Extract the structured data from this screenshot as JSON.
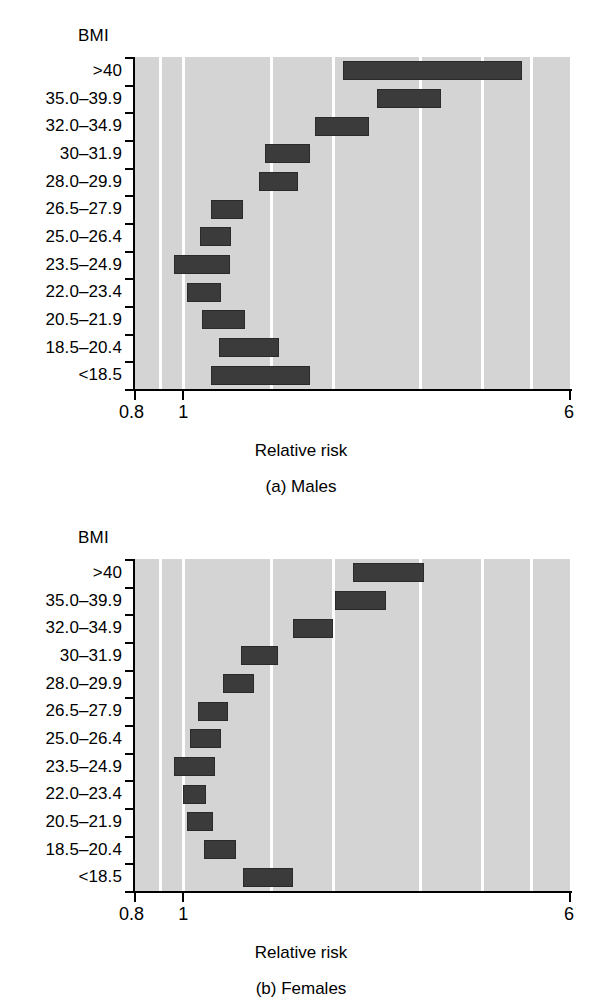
{
  "figure": {
    "panels": [
      {
        "id": "males",
        "bmi_axis_title": "BMI",
        "caption": "(a) Males",
        "xlabel": "Relative risk"
      },
      {
        "id": "females",
        "bmi_axis_title": "BMI",
        "caption": "(b) Females",
        "xlabel": "Relative risk"
      }
    ]
  },
  "chart_data": [
    {
      "type": "bar",
      "orientation": "horizontal",
      "title": "(a) Males",
      "xlabel": "Relative risk",
      "ylabel": "BMI",
      "xscale": "log",
      "xlim": [
        0.8,
        6
      ],
      "xticks": [
        0.8,
        6
      ],
      "xticklabels": [
        "0.8",
        "6"
      ],
      "gridlines": [
        0.9,
        1,
        1.5,
        2,
        3,
        4,
        5
      ],
      "grid": true,
      "legend": "none",
      "categories": [
        ">40",
        "35.0–39.9",
        "32.0–34.9",
        "30–31.9",
        "28.0–29.9",
        "26.5–27.9",
        "25.0–26.4",
        "23.5–24.9",
        "22.0–23.4",
        "20.5–21.9",
        "18.5–20.4",
        "<18.5"
      ],
      "intervals": [
        {
          "category": ">40",
          "low": 2.1,
          "high": 4.8
        },
        {
          "category": "35.0–39.9",
          "low": 2.45,
          "high": 3.3
        },
        {
          "category": "32.0–34.9",
          "low": 1.84,
          "high": 2.37
        },
        {
          "category": "30–31.9",
          "low": 1.46,
          "high": 1.8
        },
        {
          "category": "28.0–29.9",
          "low": 1.42,
          "high": 1.7
        },
        {
          "category": "26.5–27.9",
          "low": 1.14,
          "high": 1.32
        },
        {
          "category": "25.0–26.4",
          "low": 1.08,
          "high": 1.25
        },
        {
          "category": "23.5–24.9",
          "low": 0.96,
          "high": 1.24
        },
        {
          "category": "22.0–23.4",
          "low": 1.02,
          "high": 1.19
        },
        {
          "category": "20.5–21.9",
          "low": 1.09,
          "high": 1.33
        },
        {
          "category": "18.5–20.4",
          "low": 1.18,
          "high": 1.56
        },
        {
          "category": "<18.5",
          "low": 1.14,
          "high": 1.8
        }
      ]
    },
    {
      "type": "bar",
      "orientation": "horizontal",
      "title": "(b) Females",
      "xlabel": "Relative risk",
      "ylabel": "BMI",
      "xscale": "log",
      "xlim": [
        0.8,
        6
      ],
      "xticks": [
        0.8,
        6
      ],
      "xticklabels": [
        "0.8",
        "6"
      ],
      "gridlines": [
        0.9,
        1,
        1.5,
        2,
        3,
        4,
        5
      ],
      "grid": true,
      "legend": "none",
      "categories": [
        ">40",
        "35.0–39.9",
        "32.0–34.9",
        "30–31.9",
        "28.0–29.9",
        "26.5–27.9",
        "25.0–26.4",
        "23.5–24.9",
        "22.0–23.4",
        "20.5–21.9",
        "18.5–20.4",
        "<18.5"
      ],
      "intervals": [
        {
          "category": ">40",
          "low": 2.2,
          "high": 3.05
        },
        {
          "category": "35.0–39.9",
          "low": 2.02,
          "high": 2.56
        },
        {
          "category": "32.0–34.9",
          "low": 1.66,
          "high": 2.0
        },
        {
          "category": "30–31.9",
          "low": 1.31,
          "high": 1.55
        },
        {
          "category": "28.0–29.9",
          "low": 1.2,
          "high": 1.39
        },
        {
          "category": "26.5–27.9",
          "low": 1.07,
          "high": 1.23
        },
        {
          "category": "25.0–26.4",
          "low": 1.03,
          "high": 1.19
        },
        {
          "category": "23.5–24.9",
          "low": 0.96,
          "high": 1.16
        },
        {
          "category": "22.0–23.4",
          "low": 1.0,
          "high": 1.11
        },
        {
          "category": "20.5–21.9",
          "low": 1.02,
          "high": 1.15
        },
        {
          "category": "18.5–20.4",
          "low": 1.1,
          "high": 1.28
        },
        {
          "category": "<18.5",
          "low": 1.32,
          "high": 1.66
        }
      ]
    }
  ],
  "colors": {
    "bar": "#3b3b3b",
    "plot_background": "#d4d4d4",
    "gridline": "#ffffff",
    "axis": "#000000",
    "page_background": "#ffffff"
  }
}
